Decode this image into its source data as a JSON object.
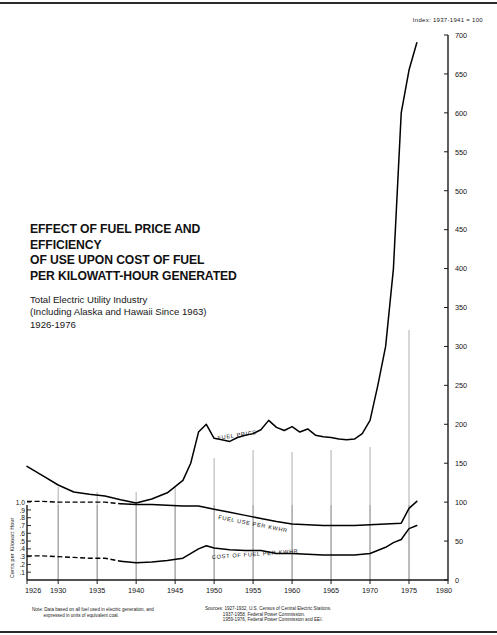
{
  "page": {
    "index_note": "Index: 1937-1941 = 100"
  },
  "title": {
    "line1": "EFFECT OF FUEL PRICE AND EFFICIENCY",
    "line2": "OF USE UPON COST OF FUEL",
    "line3": "PER KILOWATT-HOUR GENERATED",
    "sub1": "Total Electric Utility Industry",
    "sub2": "(Including Alaska and Hawaii Since 1963)",
    "sub3": "1926-1976"
  },
  "footnotes": {
    "note": "Note: Data based on all fuel used in electric generation, and\n         expressed in units of equivalent coal.",
    "sources": "Sources: 1927-1932, U.S. Census of Central Electric Stations.\n              1937-1958, Federal Power Commission.\n              1959-1976, Federal Power Commission and EEI."
  },
  "chart_data": {
    "type": "line",
    "title": "EFFECT OF FUEL PRICE AND EFFICIENCY OF USE UPON COST OF FUEL PER KILOWATT-HOUR GENERATED",
    "subtitle": "Total Electric Utility Industry (Including Alaska and Hawaii Since 1963) 1926-1976",
    "xlabel": "",
    "ylabel": "Index: 1937-1941 = 100",
    "ylabel_left": "Cents per Kilowatt Hour",
    "xlim": [
      1926,
      1980
    ],
    "ylim": [
      0,
      700
    ],
    "grid": "vertical-at-5-year-ticks",
    "legend": "inline-curve-labels",
    "x_ticks": [
      1926,
      1930,
      1935,
      1940,
      1945,
      1950,
      1955,
      1960,
      1965,
      1970,
      1975,
      1980
    ],
    "y_ticks_right": [
      0,
      50,
      100,
      150,
      200,
      250,
      300,
      350,
      400,
      450,
      500,
      550,
      600,
      650,
      700
    ],
    "y_ticks_left": [
      "1.0",
      ".9",
      ".8",
      ".7",
      ".6",
      ".5",
      ".4",
      ".3",
      ".2",
      ".1"
    ],
    "y_left_values": [
      1.0,
      0.9,
      0.8,
      0.7,
      0.6,
      0.5,
      0.4,
      0.3,
      0.2,
      0.1
    ],
    "series": [
      {
        "name": "FUEL PRICE",
        "label": "FUEL PRICE",
        "style": "solid",
        "x": [
          1926,
          1928,
          1930,
          1932,
          1934,
          1936,
          1938,
          1940,
          1942,
          1944,
          1946,
          1947,
          1948,
          1949,
          1950,
          1951,
          1952,
          1953,
          1954,
          1955,
          1956,
          1957,
          1958,
          1959,
          1960,
          1961,
          1962,
          1963,
          1964,
          1965,
          1966,
          1967,
          1968,
          1969,
          1970,
          1971,
          1972,
          1973,
          1974,
          1975,
          1976
        ],
        "values": [
          146,
          134,
          122,
          113,
          110,
          108,
          103,
          99,
          104,
          112,
          128,
          150,
          190,
          200,
          182,
          180,
          178,
          183,
          186,
          188,
          193,
          205,
          196,
          192,
          197,
          190,
          194,
          186,
          184,
          183,
          181,
          180,
          181,
          188,
          205,
          250,
          300,
          400,
          600,
          655,
          690
        ]
      },
      {
        "name": "FUEL USE PER KWHR",
        "label": "FUEL USE PER KWHR",
        "style": "dashed-then-solid",
        "dashed_until": 1938,
        "x": [
          1926,
          1928,
          1930,
          1932,
          1934,
          1936,
          1938,
          1940,
          1942,
          1944,
          1946,
          1948,
          1950,
          1952,
          1954,
          1956,
          1958,
          1960,
          1962,
          1964,
          1966,
          1968,
          1970,
          1972,
          1974,
          1975,
          1976
        ],
        "values": [
          101,
          101,
          100,
          100,
          100,
          100,
          98,
          97,
          97,
          96,
          95,
          95,
          91,
          87,
          83,
          79,
          75,
          72,
          71,
          70,
          70,
          70,
          71,
          72,
          73,
          92,
          101
        ]
      },
      {
        "name": "COST OF FUEL PER KWHR",
        "label": "COST OF FUEL PER KWHR",
        "style": "dashed-then-solid",
        "dashed_until": 1938,
        "x": [
          1926,
          1928,
          1930,
          1932,
          1934,
          1936,
          1938,
          1940,
          1942,
          1944,
          1946,
          1948,
          1949,
          1950,
          1952,
          1954,
          1956,
          1958,
          1960,
          1962,
          1964,
          1966,
          1968,
          1970,
          1972,
          1973,
          1974,
          1975,
          1976
        ],
        "values": [
          31,
          31,
          30,
          29,
          28,
          28,
          24,
          22,
          23,
          25,
          28,
          40,
          44,
          41,
          39,
          38,
          38,
          34,
          34,
          33,
          32,
          32,
          32,
          34,
          42,
          48,
          52,
          66,
          70
        ]
      }
    ]
  }
}
